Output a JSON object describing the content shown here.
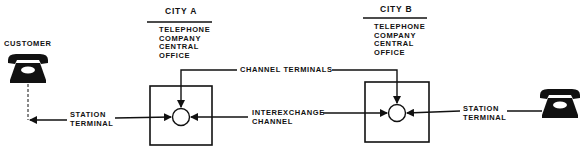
{
  "diagram": {
    "customer_label": "CUSTOMER",
    "city_a": {
      "title": "CITY A",
      "office_lines": [
        "TELEPHONE",
        "COMPANY",
        "CENTRAL",
        "OFFICE"
      ]
    },
    "city_b": {
      "title": "CITY B",
      "office_lines": [
        "TELEPHONE",
        "COMPANY",
        "CENTRAL",
        "OFFICE"
      ]
    },
    "channel_terminals_label": "CHANNEL TERMINALS",
    "interexchange": [
      "INTEREXCHANGE",
      "CHANNEL"
    ],
    "station_terminal_left": [
      "STATION",
      "TERMINAL"
    ],
    "station_terminal_right": [
      "STATION",
      "TERMINAL"
    ],
    "icons": {
      "left_phone": "telephone-icon",
      "right_phone": "telephone-icon"
    },
    "colors": {
      "ink": "#111111",
      "background": "#ffffff"
    }
  }
}
